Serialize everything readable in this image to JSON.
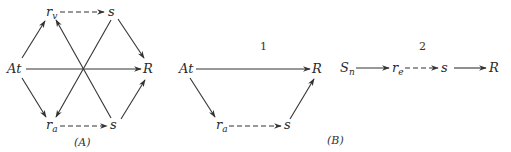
{
  "figure": {
    "panelA": {
      "caption": "(A)",
      "nodes": {
        "rv": {
          "base": "r",
          "sub": "v"
        },
        "s_top": {
          "base": "s"
        },
        "At": {
          "base": "At"
        },
        "R": {
          "base": "R"
        },
        "ra": {
          "base": "r",
          "sub": "a"
        },
        "s_bottom": {
          "base": "s"
        }
      },
      "edges": [
        {
          "from": "At",
          "to": "rv",
          "style": "solid"
        },
        {
          "from": "rv",
          "to": "s_top",
          "style": "dashed"
        },
        {
          "from": "s_top",
          "to": "R",
          "style": "solid"
        },
        {
          "from": "At",
          "to": "R",
          "style": "solid"
        },
        {
          "from": "At",
          "to": "ra",
          "style": "solid"
        },
        {
          "from": "ra",
          "to": "s_bottom",
          "style": "dashed"
        },
        {
          "from": "s_bottom",
          "to": "R",
          "style": "solid"
        },
        {
          "from": "s_bottom",
          "to": "rv",
          "style": "solid"
        },
        {
          "from": "s_top",
          "to": "ra",
          "style": "solid"
        }
      ]
    },
    "panelB": {
      "caption": "(B)",
      "diagram1": {
        "label": "1",
        "nodes": {
          "At": {
            "base": "At"
          },
          "R": {
            "base": "R"
          },
          "ra": {
            "base": "r",
            "sub": "a"
          },
          "s": {
            "base": "s"
          }
        },
        "edges": [
          {
            "from": "At",
            "to": "R",
            "style": "solid"
          },
          {
            "from": "At",
            "to": "ra",
            "style": "solid"
          },
          {
            "from": "ra",
            "to": "s",
            "style": "dashed"
          },
          {
            "from": "s",
            "to": "R",
            "style": "solid"
          }
        ]
      },
      "diagram2": {
        "label": "2",
        "nodes": {
          "Sn": {
            "base": "S",
            "sub": "n"
          },
          "re": {
            "base": "r",
            "sub": "e"
          },
          "s": {
            "base": "s"
          },
          "R": {
            "base": "R"
          }
        },
        "edges": [
          {
            "from": "Sn",
            "to": "re",
            "style": "solid"
          },
          {
            "from": "re",
            "to": "s",
            "style": "dashed"
          },
          {
            "from": "s",
            "to": "R",
            "style": "solid"
          }
        ]
      }
    }
  }
}
